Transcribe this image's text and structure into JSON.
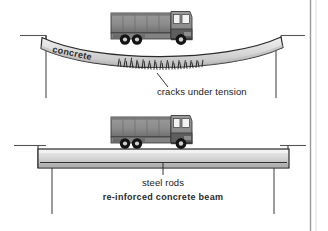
{
  "figure": {
    "background_color": "#ffffff",
    "border_color": "#9a9a9a",
    "width": 328,
    "height": 231
  },
  "palette": {
    "beam_fill_light": "#e9e9e9",
    "beam_fill_mid": "#cfcfcf",
    "beam_fill_dark": "#b4b4b4",
    "outline": "#2b2b2b",
    "ground_line": "#555555",
    "truck_body": "#8a8a8a",
    "truck_dark": "#4a4a4a",
    "truck_window": "#f2f2f2",
    "wheel": "#1a1a1a",
    "crack": "#111111",
    "text": "#1b1b1b"
  },
  "panels": [
    {
      "id": "unreinforced",
      "name": "sagging-concrete-beam-panel",
      "beam_type": "plain concrete, sagging",
      "labels": {
        "beam_material": "concrete",
        "failure": "cracks under tension"
      }
    },
    {
      "id": "reinforced",
      "name": "reinforced-concrete-beam-panel",
      "beam_type": "reinforced concrete, straight",
      "labels": {
        "rods": "steel rods",
        "caption": "re-inforced concrete beam"
      }
    }
  ],
  "truck": {
    "name": "truck",
    "axle_count": 3,
    "description": "box truck travelling right, cab at right end"
  }
}
